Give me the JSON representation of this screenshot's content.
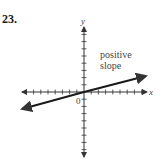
{
  "problem": {
    "number": "23."
  },
  "diagram": {
    "x_axis_label": "x",
    "y_axis_label": "y",
    "origin_label": "0",
    "annotation_line1": "positive",
    "annotation_line2": "slope",
    "x_ticks_left": 8,
    "x_ticks_right": 8,
    "y_ticks_up": 8,
    "y_ticks_down": 8,
    "line_color": "#1a1a1a",
    "axis_color": "#333333"
  }
}
